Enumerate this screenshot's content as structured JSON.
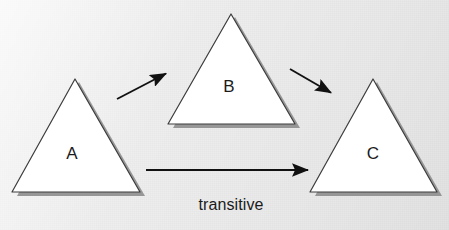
{
  "figure": {
    "caption_text": "transitive",
    "background_color": "#eeeeee",
    "shape_fill_color": "#ffffff",
    "shape_stroke_color": "#3c3c3c",
    "shadow_color": "#8f8f8f",
    "arrow_color": "#111111",
    "width": 449,
    "height": 230
  },
  "nodes": [
    {
      "id": "A",
      "label": "A",
      "shape": "triangle",
      "apex": {
        "x": 75,
        "y": 79
      },
      "base_left": {
        "x": 12,
        "y": 192
      },
      "base_right": {
        "x": 140,
        "y": 192
      },
      "label_pos": {
        "x": 72,
        "y": 153
      }
    },
    {
      "id": "B",
      "label": "B",
      "shape": "triangle",
      "apex": {
        "x": 231,
        "y": 14
      },
      "base_left": {
        "x": 168,
        "y": 124
      },
      "base_right": {
        "x": 295,
        "y": 124
      },
      "label_pos": {
        "x": 229,
        "y": 86
      }
    },
    {
      "id": "C",
      "label": "C",
      "shape": "triangle",
      "apex": {
        "x": 373,
        "y": 79
      },
      "base_left": {
        "x": 310,
        "y": 192
      },
      "base_right": {
        "x": 437,
        "y": 192
      },
      "label_pos": {
        "x": 373,
        "y": 153
      }
    }
  ],
  "edges": [
    {
      "id": "a-to-b",
      "from": "A",
      "to": "B",
      "label": "",
      "start": {
        "x": 117,
        "y": 99
      },
      "end": {
        "x": 168,
        "y": 72
      }
    },
    {
      "id": "b-to-c",
      "from": "B",
      "to": "C",
      "label": "",
      "start": {
        "x": 290,
        "y": 69
      },
      "end": {
        "x": 333,
        "y": 94
      }
    },
    {
      "id": "a-to-c",
      "from": "A",
      "to": "C",
      "label": "transitive",
      "start": {
        "x": 146,
        "y": 170
      },
      "end": {
        "x": 311,
        "y": 170
      },
      "label_pos": {
        "x": 231,
        "y": 205
      }
    }
  ]
}
